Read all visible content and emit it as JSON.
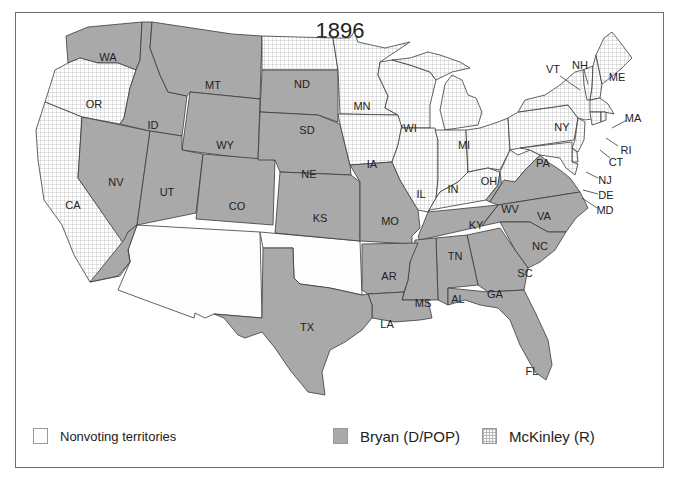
{
  "title": "1896",
  "legend": [
    {
      "key": "nonvoting",
      "label": "Nonvoting territories"
    },
    {
      "key": "bryan",
      "label": "Bryan (D/POP)"
    },
    {
      "key": "mckinley",
      "label": "McKinley (R)"
    }
  ],
  "colors": {
    "bryan": "#a9a9a9",
    "mckinley_grid": "#b5b5b5",
    "nonvoting": "#fdfdfd",
    "border": "#3a3a3a",
    "frame": "#6e6e6e"
  },
  "states": {
    "WA": {
      "label": "WA",
      "winner": "Bryan"
    },
    "OR": {
      "label": "OR",
      "winner": "McKinley"
    },
    "CA": {
      "label": "CA",
      "winner": "McKinley"
    },
    "NV": {
      "label": "NV",
      "winner": "Bryan"
    },
    "ID": {
      "label": "ID",
      "winner": "Bryan"
    },
    "MT": {
      "label": "MT",
      "winner": "Bryan"
    },
    "WY": {
      "label": "WY",
      "winner": "Bryan"
    },
    "UT": {
      "label": "UT",
      "winner": "Bryan"
    },
    "CO": {
      "label": "CO",
      "winner": "Bryan"
    },
    "ND": {
      "label": "ND",
      "winner": "McKinley"
    },
    "SD": {
      "label": "SD",
      "winner": "Bryan"
    },
    "NE": {
      "label": "NE",
      "winner": "Bryan"
    },
    "KS": {
      "label": "KS",
      "winner": "Bryan"
    },
    "MN": {
      "label": "MN",
      "winner": "McKinley"
    },
    "IA": {
      "label": "IA",
      "winner": "McKinley"
    },
    "MO": {
      "label": "MO",
      "winner": "Bryan"
    },
    "WI": {
      "label": "WI",
      "winner": "McKinley"
    },
    "IL": {
      "label": "IL",
      "winner": "McKinley"
    },
    "MI": {
      "label": "MI",
      "winner": "McKinley"
    },
    "IN": {
      "label": "IN",
      "winner": "McKinley"
    },
    "OH": {
      "label": "OH",
      "winner": "McKinley"
    },
    "KY": {
      "label": "KY",
      "winner": "McKinley (split)"
    },
    "WV": {
      "label": "WV",
      "winner": "McKinley"
    },
    "PA": {
      "label": "PA",
      "winner": "McKinley"
    },
    "NY": {
      "label": "NY",
      "winner": "McKinley"
    },
    "VT": {
      "label": "VT",
      "winner": "McKinley"
    },
    "NH": {
      "label": "NH",
      "winner": "McKinley"
    },
    "ME": {
      "label": "ME",
      "winner": "McKinley"
    },
    "MA": {
      "label": "MA",
      "winner": "McKinley"
    },
    "RI": {
      "label": "RI",
      "winner": "McKinley"
    },
    "CT": {
      "label": "CT",
      "winner": "McKinley"
    },
    "NJ": {
      "label": "NJ",
      "winner": "McKinley"
    },
    "DE": {
      "label": "DE",
      "winner": "McKinley"
    },
    "MD": {
      "label": "MD",
      "winner": "McKinley"
    },
    "VA": {
      "label": "VA",
      "winner": "Bryan"
    },
    "NC": {
      "label": "NC",
      "winner": "Bryan"
    },
    "SC": {
      "label": "SC",
      "winner": "Bryan"
    },
    "GA": {
      "label": "GA",
      "winner": "Bryan"
    },
    "FL": {
      "label": "FL",
      "winner": "Bryan"
    },
    "AL": {
      "label": "AL",
      "winner": "Bryan"
    },
    "MS": {
      "label": "MS",
      "winner": "Bryan"
    },
    "TN": {
      "label": "TN",
      "winner": "Bryan"
    },
    "AR": {
      "label": "AR",
      "winner": "Bryan"
    },
    "LA": {
      "label": "LA",
      "winner": "Bryan"
    },
    "TX": {
      "label": "TX",
      "winner": "Bryan"
    },
    "AZ_NM_OK": {
      "label": "",
      "winner": "Nonvoting territories"
    }
  }
}
